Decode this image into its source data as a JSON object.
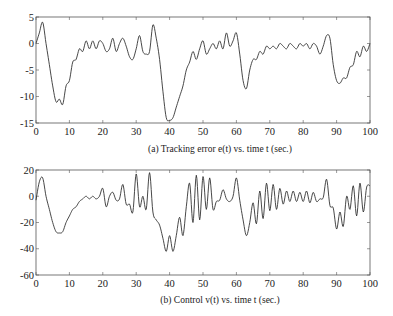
{
  "chart_data": [
    {
      "type": "line",
      "title": "",
      "caption": "(a) Tracking error e(t) vs. time t (sec.)",
      "xlabel": "time t (sec.)",
      "ylabel": "e(t)",
      "xlim": [
        0,
        100
      ],
      "ylim": [
        -15,
        5
      ],
      "xticks": [
        0,
        10,
        20,
        30,
        40,
        50,
        60,
        70,
        80,
        90,
        100
      ],
      "yticks": [
        5,
        0,
        -5,
        -10,
        -15
      ],
      "grid": false,
      "legend": null,
      "series": [
        {
          "name": "e(t)",
          "x": [
            0,
            1,
            2,
            3,
            4,
            5,
            6,
            7,
            8,
            9,
            10,
            11,
            12,
            13,
            14,
            15,
            16,
            17,
            18,
            19,
            20,
            21,
            22,
            23,
            24,
            25,
            26,
            27,
            28,
            29,
            30,
            31,
            32,
            33,
            34,
            35,
            36,
            37,
            38,
            39,
            40,
            41,
            42,
            43,
            44,
            45,
            46,
            47,
            48,
            49,
            50,
            51,
            52,
            53,
            54,
            55,
            56,
            57,
            58,
            59,
            60,
            61,
            62,
            63,
            64,
            65,
            66,
            67,
            68,
            69,
            70,
            71,
            72,
            73,
            74,
            75,
            76,
            77,
            78,
            79,
            80,
            81,
            82,
            83,
            84,
            85,
            86,
            87,
            88,
            89,
            90,
            91,
            92,
            93,
            94,
            95,
            96,
            97,
            98,
            99,
            100
          ],
          "values": [
            0,
            2,
            4,
            0,
            -4,
            -8,
            -11,
            -10.5,
            -11.5,
            -8,
            -7,
            -3.5,
            -3,
            -1,
            -1.5,
            0.5,
            -1,
            0.5,
            -1,
            0.5,
            0,
            -1.5,
            -1,
            1,
            -1.5,
            0,
            1,
            -0.5,
            -2.5,
            -3,
            -1,
            1.5,
            -1.5,
            -2,
            -1.5,
            3.5,
            1,
            -3,
            -9,
            -14,
            -14.5,
            -14,
            -12,
            -10,
            -8,
            -5,
            -3.5,
            -1.5,
            -3,
            -1,
            0.5,
            -2,
            -1,
            0,
            -1,
            0.5,
            -1,
            2,
            -0.5,
            0.5,
            2,
            -2,
            -7,
            -8.5,
            -5,
            -3,
            -3,
            -1.5,
            -2,
            -0.5,
            -1,
            -0.5,
            -1,
            0,
            -0.5,
            -1,
            0,
            -0.5,
            -1,
            0,
            -0.5,
            0,
            -1,
            0,
            -0.5,
            -2,
            -0.5,
            1.5,
            1,
            -4,
            -7,
            -7.5,
            -6.5,
            -6.5,
            -4.5,
            -4,
            -1.5,
            -2.5,
            -0.5,
            -1.5,
            0
          ]
        }
      ]
    },
    {
      "type": "line",
      "title": "",
      "caption": "(b) Control v(t) vs. time t (sec.)",
      "xlabel": "time t (sec.)",
      "ylabel": "v(t)",
      "xlim": [
        0,
        100
      ],
      "ylim": [
        -60,
        20
      ],
      "xticks": [
        0,
        10,
        20,
        30,
        40,
        50,
        60,
        70,
        80,
        90,
        100
      ],
      "yticks": [
        20,
        0,
        -20,
        -40,
        -60
      ],
      "grid": false,
      "legend": null,
      "series": [
        {
          "name": "v(t)",
          "x": [
            0,
            1,
            2,
            3,
            4,
            5,
            6,
            7,
            8,
            9,
            10,
            11,
            12,
            13,
            14,
            15,
            16,
            17,
            18,
            19,
            20,
            21,
            22,
            23,
            24,
            25,
            26,
            27,
            28,
            29,
            30,
            31,
            32,
            33,
            34,
            35,
            36,
            37,
            38,
            39,
            40,
            41,
            42,
            43,
            44,
            45,
            46,
            47,
            48,
            49,
            50,
            51,
            52,
            53,
            54,
            55,
            56,
            57,
            58,
            59,
            60,
            61,
            62,
            63,
            64,
            65,
            66,
            67,
            68,
            69,
            70,
            71,
            72,
            73,
            74,
            75,
            76,
            77,
            78,
            79,
            80,
            81,
            82,
            83,
            84,
            85,
            86,
            87,
            88,
            89,
            90,
            91,
            92,
            93,
            94,
            95,
            96,
            97,
            98,
            99,
            100
          ],
          "values": [
            -3,
            11,
            14,
            0,
            -10,
            -20,
            -27,
            -28,
            -27,
            -20,
            -15,
            -10,
            -8,
            -4,
            -2,
            0,
            -2,
            0,
            -2,
            0,
            6,
            -8,
            0,
            3,
            -3,
            -2,
            9,
            -6,
            -6,
            -12,
            17,
            -8,
            0,
            -10,
            18,
            -12,
            -18,
            -22,
            -32,
            -42,
            -30,
            -42,
            -30,
            -16,
            -30,
            -8,
            10,
            -20,
            16,
            -18,
            15,
            -10,
            14,
            -10,
            -4,
            -3,
            5,
            -2,
            -4,
            0,
            14,
            -3,
            -18,
            -30,
            -20,
            -5,
            -21,
            4,
            -17,
            10,
            -11,
            9,
            -10,
            6,
            -6,
            4,
            -4,
            4,
            -4,
            3,
            -4,
            4,
            -5,
            3,
            -4,
            -2,
            -1,
            13,
            -7,
            -9,
            -25,
            -12,
            -23,
            0,
            -10,
            8,
            -15,
            10,
            -12,
            7,
            8
          ]
        }
      ]
    }
  ],
  "plots": {
    "a": {
      "caption": "(a) Tracking error e(t) vs. time t (sec.)",
      "ytick_labels": [
        "5",
        "0",
        "-5",
        "-10",
        "-15"
      ],
      "xtick_labels": [
        "0",
        "10",
        "20",
        "30",
        "40",
        "50",
        "60",
        "70",
        "80",
        "90",
        "100"
      ]
    },
    "b": {
      "caption": "(b) Control v(t) vs. time t (sec.)",
      "ytick_labels": [
        "20",
        "0",
        "-20",
        "-40",
        "-60"
      ],
      "xtick_labels": [
        "0",
        "10",
        "20",
        "30",
        "40",
        "50",
        "60",
        "70",
        "80",
        "90",
        "100"
      ]
    }
  },
  "colors": {
    "line": "#333333",
    "axis": "#555555",
    "background": "#ffffff"
  }
}
